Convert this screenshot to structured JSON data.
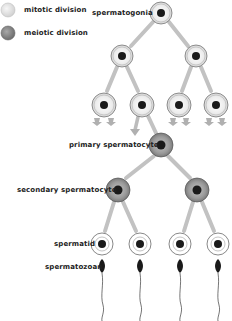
{
  "legend": {
    "items": [
      {
        "label": "mitotic division",
        "color": "#e6e6e6"
      },
      {
        "label": "meiotic division",
        "color": "#8c8c8c"
      }
    ]
  },
  "labels": {
    "spermatogonia": "spermatogonia",
    "primary_spermatocyte": "primary spermatocyte",
    "secondary_spermatocyte": "secondary spermatocyte",
    "spermatid": "spermatid",
    "spermatozoan": "spermatozoan"
  },
  "colors": {
    "mitotic_fill": "#f0f0f0",
    "meiotic_fill": "#9a9a9a",
    "nucleus": "#1a1a1a",
    "arrow": "#b5b5b5",
    "outline": "#666666"
  },
  "stages": [
    {
      "name": "spermatogonia",
      "type": "mitotic",
      "count": 1
    },
    {
      "name": "mitotic-generation-2",
      "type": "mitotic",
      "count": 2
    },
    {
      "name": "mitotic-generation-3",
      "type": "mitotic",
      "count": 4
    },
    {
      "name": "primary spermatocyte",
      "type": "meiotic",
      "count": 1
    },
    {
      "name": "secondary spermatocyte",
      "type": "meiotic",
      "count": 2
    },
    {
      "name": "spermatid",
      "type": "product",
      "count": 4
    },
    {
      "name": "spermatozoan",
      "type": "product",
      "count": 4
    }
  ]
}
